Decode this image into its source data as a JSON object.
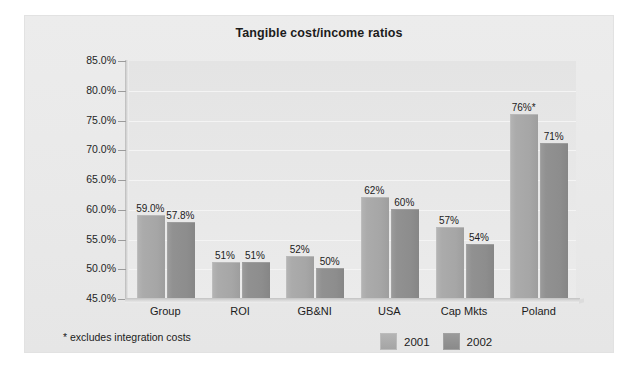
{
  "figure": {
    "background_color": "#ffffff",
    "panel_color": "#ececec"
  },
  "chart_data": {
    "type": "bar",
    "title": "Tangible cost/income ratios",
    "xlabel": "",
    "ylabel": "",
    "ylim": [
      45,
      85
    ],
    "ytick_labels": [
      "85.0%",
      "80.0%",
      "75.0%",
      "70.0%",
      "65.0%",
      "60.0%",
      "55.0%",
      "50.0%",
      "45.0%"
    ],
    "ytick_values": [
      85,
      80,
      75,
      70,
      65,
      60,
      55,
      50,
      45
    ],
    "grid": true,
    "legend_position": "bottom-right",
    "categories": [
      "Group",
      "ROI",
      "GB&NI",
      "USA",
      "Cap Mkts",
      "Poland"
    ],
    "series": [
      {
        "name": "2001",
        "color": "#a8a8a8",
        "values": [
          59.0,
          51.0,
          52.0,
          62.0,
          57.0,
          76.0
        ],
        "labels": [
          "59.0%",
          "51%",
          "52%",
          "62%",
          "57%",
          "76%*"
        ]
      },
      {
        "name": "2002",
        "color": "#8f8f8f",
        "values": [
          57.8,
          51.0,
          50.0,
          60.0,
          54.0,
          71.0
        ],
        "labels": [
          "57.8%",
          "51%",
          "50%",
          "60%",
          "54%",
          "71%"
        ]
      }
    ],
    "annotations": [
      "* excludes integration costs"
    ]
  },
  "footnote": "* excludes integration costs",
  "legend": {
    "items": [
      {
        "label": "2001",
        "color": "#a8a8a8"
      },
      {
        "label": "2002",
        "color": "#8f8f8f"
      }
    ]
  }
}
